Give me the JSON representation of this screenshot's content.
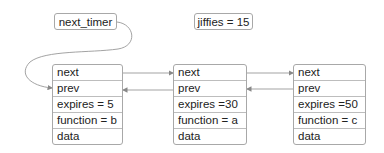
{
  "labels": {
    "next_timer": "next_timer",
    "jiffies": "jiffies = 15"
  },
  "nodes": [
    {
      "fields": [
        "next",
        "prev",
        "expires = 5",
        "function = b",
        "data"
      ]
    },
    {
      "fields": [
        "next",
        "prev",
        "expires =30",
        "function = a",
        "data"
      ]
    },
    {
      "fields": [
        "next",
        "prev",
        "expires =50",
        "function = c",
        "data"
      ]
    }
  ],
  "colors": {
    "border": "#a8a8a8",
    "line": "#999999",
    "text": "#222222"
  }
}
